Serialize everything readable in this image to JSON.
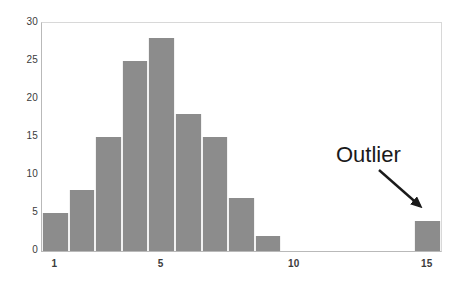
{
  "chart_data": {
    "type": "bar",
    "title": "",
    "subtitle": "",
    "xlabel": "",
    "ylabel": "",
    "x": [
      1,
      2,
      3,
      4,
      5,
      6,
      7,
      8,
      9,
      15
    ],
    "values": [
      5,
      8,
      15,
      25,
      28,
      18,
      15,
      7,
      2,
      4
    ],
    "categories": [
      "1",
      "2",
      "3",
      "4",
      "5",
      "6",
      "7",
      "8",
      "9",
      "15"
    ],
    "bars": [
      {
        "x": 1,
        "value": 5,
        "outlier": false
      },
      {
        "x": 2,
        "value": 8,
        "outlier": false
      },
      {
        "x": 3,
        "value": 15,
        "outlier": false
      },
      {
        "x": 4,
        "value": 25,
        "outlier": false
      },
      {
        "x": 5,
        "value": 28,
        "outlier": false
      },
      {
        "x": 6,
        "value": 18,
        "outlier": false
      },
      {
        "x": 7,
        "value": 15,
        "outlier": false
      },
      {
        "x": 8,
        "value": 7,
        "outlier": false
      },
      {
        "x": 9,
        "value": 2,
        "outlier": false
      },
      {
        "x": 15,
        "value": 4,
        "outlier": true
      }
    ],
    "xlim": [
      0.5,
      15.5
    ],
    "ylim": [
      0,
      30
    ],
    "yticks": [
      0,
      5,
      10,
      15,
      20,
      25,
      30
    ],
    "ytick_labels": [
      "0",
      "5",
      "10",
      "15",
      "20",
      "25",
      "30"
    ],
    "xticks": [
      1,
      5,
      10,
      15
    ],
    "xtick_labels": [
      "1",
      "5",
      "10",
      "15"
    ],
    "grid": false,
    "legend": "none",
    "bar_color": "#8c8c8c",
    "bar_edge_color": "#f2f2f2",
    "background_color": "#ffffff",
    "axis_color": "#b9b9b9",
    "tick_label_color": "#3c3c3c",
    "annotations": [
      {
        "text": "Outlier",
        "color": "#1a1a1a",
        "points_to_x": 15,
        "points_to_value": 4
      }
    ]
  }
}
